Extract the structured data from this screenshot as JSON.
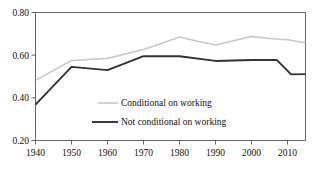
{
  "chart_data": {
    "type": "line",
    "title": "",
    "subtitle": "",
    "xlabel": "",
    "ylabel": "",
    "xlim": [
      1940,
      2015
    ],
    "ylim": [
      0.2,
      0.8
    ],
    "grid": false,
    "legend_position": "inside-center",
    "xticks": [
      1940,
      1950,
      1960,
      1970,
      1980,
      1990,
      2000,
      2010
    ],
    "xtick_labels": [
      "1940",
      "1950",
      "1960",
      "1970",
      "1980",
      "1990",
      "2000",
      "2010"
    ],
    "yticks": [
      0.2,
      0.4,
      0.6,
      0.8
    ],
    "ytick_labels": [
      "0.20",
      "0.40",
      "0.60",
      "0.80"
    ],
    "series": [
      {
        "name": "Conditional on working",
        "color": "#c9c9c9",
        "width": 1.6,
        "x": [
          1940,
          1950,
          1960,
          1970,
          1975,
          1980,
          1985,
          1990,
          1995,
          2000,
          2005,
          2010,
          2015
        ],
        "values": [
          0.482,
          0.575,
          0.585,
          0.627,
          0.655,
          0.685,
          0.665,
          0.648,
          0.668,
          0.688,
          0.678,
          0.672,
          0.658
        ]
      },
      {
        "name": "Not conditional on working",
        "color": "#333333",
        "width": 1.9,
        "x": [
          1940,
          1950,
          1960,
          1970,
          1980,
          1990,
          2000,
          2007,
          2011,
          2015
        ],
        "values": [
          0.368,
          0.545,
          0.53,
          0.595,
          0.595,
          0.573,
          0.577,
          0.578,
          0.51,
          0.511
        ]
      }
    ],
    "legend": [
      {
        "label": "Conditional on working",
        "color": "#c9c9c9",
        "width": 1.6
      },
      {
        "label": "Not conditional on working",
        "color": "#333333",
        "width": 1.9
      }
    ]
  }
}
